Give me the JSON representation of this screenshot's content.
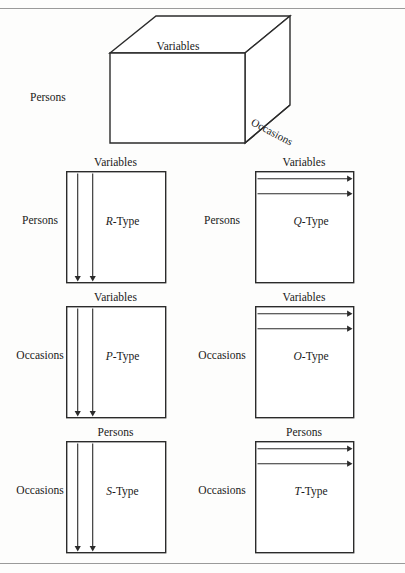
{
  "figure": {
    "title_present": false,
    "rules": {
      "top_y": 8,
      "bottom_y": 563
    },
    "cube": {
      "name": "data-box-cube",
      "labels": {
        "top_face": "Variables",
        "left_side": "Persons",
        "depth_edge": "Occasions"
      },
      "geometry": {
        "front_top_left": [
          110,
          53
        ],
        "front_top_right": [
          245,
          53
        ],
        "front_bottom_left": [
          110,
          143
        ],
        "front_bottom_right": [
          245,
          143
        ],
        "back_top_left": [
          156,
          16
        ],
        "back_top_right": [
          290,
          16
        ],
        "back_bottom_right": [
          290,
          105
        ]
      }
    },
    "panels": [
      {
        "id": "r-type",
        "type_letter": "R",
        "type_suffix": "-Type",
        "type_label": "R-Type",
        "top_label": "Variables",
        "side_label": "Persons",
        "arrow_direction": "down",
        "arrow_count": 2,
        "box": {
          "x": 66,
          "y": 171,
          "w": 99,
          "h": 111
        },
        "arrows_at": [
          77,
          92
        ],
        "side_label_x": 40,
        "side_label_y": 221
      },
      {
        "id": "q-type",
        "type_letter": "Q",
        "type_suffix": "-Type",
        "type_label": "Q-Type",
        "top_label": "Variables",
        "side_label": "Persons",
        "arrow_direction": "right",
        "arrow_count": 2,
        "box": {
          "x": 255,
          "y": 171,
          "w": 98,
          "h": 111
        },
        "arrows_at": [
          178,
          193
        ],
        "side_label_x": 222,
        "side_label_y": 221
      },
      {
        "id": "p-type",
        "type_letter": "P",
        "type_suffix": "-Type",
        "type_label": "P-Type",
        "top_label": "Variables",
        "side_label": "Occasions",
        "arrow_direction": "down",
        "arrow_count": 2,
        "box": {
          "x": 66,
          "y": 306,
          "w": 99,
          "h": 111
        },
        "arrows_at": [
          77,
          92
        ],
        "side_label_x": 40,
        "side_label_y": 356
      },
      {
        "id": "o-type",
        "type_letter": "O",
        "type_suffix": "-Type",
        "type_label": "O-Type",
        "top_label": "Variables",
        "side_label": "Occasions",
        "arrow_direction": "right",
        "arrow_count": 2,
        "box": {
          "x": 255,
          "y": 306,
          "w": 98,
          "h": 111
        },
        "arrows_at": [
          313,
          328
        ],
        "side_label_x": 222,
        "side_label_y": 356
      },
      {
        "id": "s-type",
        "type_letter": "S",
        "type_suffix": "-Type",
        "type_label": "S-Type",
        "top_label": "Persons",
        "side_label": "Occasions",
        "arrow_direction": "down",
        "arrow_count": 2,
        "box": {
          "x": 66,
          "y": 441,
          "w": 99,
          "h": 111
        },
        "arrows_at": [
          77,
          92
        ],
        "side_label_x": 40,
        "side_label_y": 491
      },
      {
        "id": "t-type",
        "type_letter": "T",
        "type_suffix": "-Type",
        "type_label": "T-Type",
        "top_label": "Persons",
        "side_label": "Occasions",
        "arrow_direction": "right",
        "arrow_count": 2,
        "box": {
          "x": 255,
          "y": 441,
          "w": 98,
          "h": 111
        },
        "arrows_at": [
          448,
          463
        ],
        "side_label_x": 222,
        "side_label_y": 491
      }
    ],
    "colors": {
      "ink": "#1a1a1a",
      "rule": "#9a9a9a",
      "paper": "#fdfdfc",
      "stroke": "#2b2b2b"
    }
  }
}
